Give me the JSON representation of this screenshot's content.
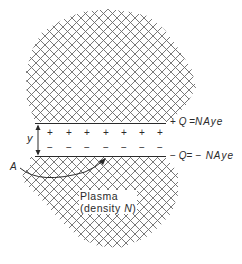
{
  "diagram": {
    "upper_plate_label_sign": "+",
    "upper_plate_label_lhs": "Q",
    "upper_plate_label_eq": "=",
    "upper_plate_label_rhs": "NAye",
    "lower_plate_label_sign": "−",
    "lower_plate_label_lhs": "Q",
    "lower_plate_label_eq": "=",
    "lower_plate_label_rhs": "− NAye",
    "gap_label": "y",
    "area_label": "A",
    "region_label_line1": "Plasma",
    "region_label_line2_prefix": "(density ",
    "region_label_line2_var": "N",
    "region_label_line2_suffix": ")",
    "positive_charges": [
      "+",
      "+",
      "+",
      "+",
      "+",
      "+",
      "+"
    ],
    "negative_charges": [
      "−",
      "−",
      "−",
      "−",
      "−",
      "−",
      "−"
    ],
    "colors": {
      "ink": "#2a2a2a",
      "hatch": "#6a6a6a",
      "background": "#ffffff"
    }
  }
}
